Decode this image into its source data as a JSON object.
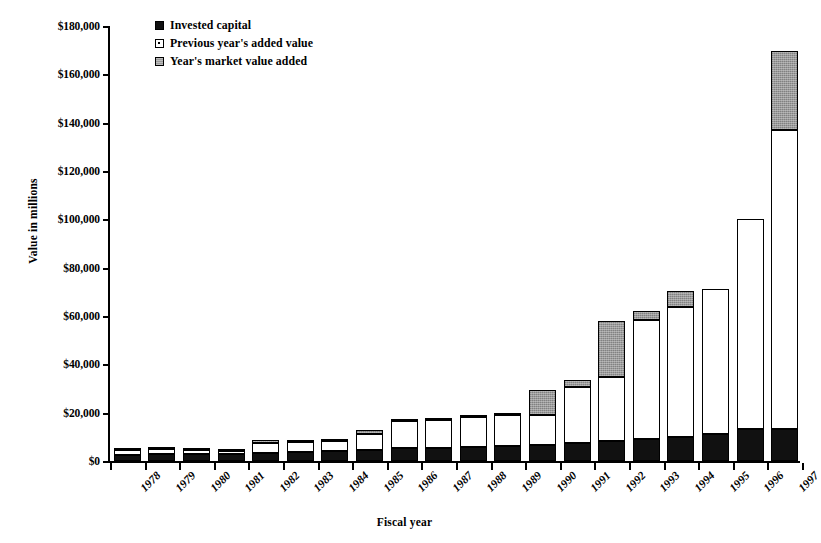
{
  "chart_data": {
    "type": "bar",
    "subtype": "stacked-bar",
    "title": "",
    "xlabel": "Fiscal year",
    "ylabel": "Value in millions",
    "ylim": [
      0,
      180000
    ],
    "ytick_step": 20000,
    "ytick_labels": [
      "$180,000",
      "$160,000",
      "$140,000",
      "$120,000",
      "$100,000",
      "$80,000",
      "$60,000",
      "$40,000",
      "$20,000",
      "$0"
    ],
    "ytick_values": [
      180000,
      160000,
      140000,
      120000,
      100000,
      80000,
      60000,
      40000,
      20000,
      0
    ],
    "grid": false,
    "legend_position": "top-left-inside",
    "categories": [
      "1978",
      "1979",
      "1980",
      "1981",
      "1982",
      "1983",
      "1984",
      "1985",
      "1986",
      "1987",
      "1988",
      "1989",
      "1990",
      "1991",
      "1992",
      "1993",
      "1994",
      "1995",
      "1996",
      "1997"
    ],
    "series": [
      {
        "name": "Invested capital",
        "color": "#111111",
        "values": [
          2600,
          2700,
          2700,
          2800,
          3400,
          3700,
          4100,
          4600,
          5200,
          5400,
          5800,
          6200,
          6600,
          7400,
          8300,
          9000,
          10000,
          11200,
          13100,
          13200
        ]
      },
      {
        "name": "Previous year's added value",
        "color": "#ffffff",
        "values": [
          2000,
          2200,
          1700,
          1500,
          4200,
          4000,
          4100,
          6500,
          11500,
          11600,
          12400,
          13000,
          12400,
          23100,
          26500,
          49500,
          53800,
          59800,
          86900,
          123900
        ]
      },
      {
        "name": "Year's market value added",
        "color": "#9a9a9a",
        "values": [
          200,
          200,
          200,
          200,
          1000,
          200,
          400,
          1700,
          500,
          400,
          400,
          300,
          10200,
          3200,
          23000,
          3500,
          6400,
          0,
          0,
          32700
        ]
      }
    ],
    "totals": [
      4800,
      5100,
      4600,
      4500,
      8600,
      7900,
      8600,
      12800,
      17200,
      17400,
      18600,
      19500,
      29200,
      33700,
      57800,
      62000,
      70200,
      71000,
      100000,
      169800
    ]
  },
  "legend": {
    "items": [
      {
        "label": "Invested capital",
        "swatch": "legend-swatch-invested"
      },
      {
        "label": "Previous year's added value",
        "swatch": "legend-swatch-previous"
      },
      {
        "label": "Year's market value added",
        "swatch": "legend-swatch-mva"
      }
    ]
  }
}
